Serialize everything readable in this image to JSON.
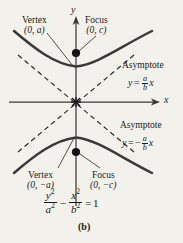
{
  "figure": {
    "caption": "(b)",
    "type": "hyperbola-diagram",
    "orientation": "vertical-transverse-axis",
    "background_color": "#f3f1ec",
    "ink_color": "#1c1b19",
    "axes": {
      "x_label": "x",
      "y_label": "y",
      "origin_px": [
        76,
        102
      ]
    },
    "labels": {
      "vertex_top_title": "Vertex",
      "vertex_top_coords": "(0, a)",
      "focus_top_title": "Focus",
      "focus_top_coords": "(0, c)",
      "vertex_bottom_title": "Vertex",
      "vertex_bottom_coords": "(0, −a)",
      "focus_bottom_title": "Focus",
      "focus_bottom_coords": "(0, −c)",
      "asymptote_top_title": "Asymptote",
      "asymptote_bottom_title": "Asymptote"
    },
    "equations": {
      "asymptote_positive": {
        "lhs": "y",
        "equals": "=",
        "sign": "",
        "numerator": "a",
        "denominator": "b",
        "variable": "x",
        "plain": "y = (a/b) x"
      },
      "asymptote_negative": {
        "lhs": "y",
        "equals": "=",
        "sign": "−",
        "numerator": "a",
        "denominator": "b",
        "variable": "x",
        "plain": "y = −(a/b) x"
      },
      "hyperbola": {
        "term1_num": "y",
        "term1_num_exp": "2",
        "term1_den": "a",
        "term1_den_exp": "2",
        "operator": "−",
        "term2_num": "x",
        "term2_num_exp": "2",
        "term2_den": "b",
        "term2_den_exp": "2",
        "equals": "=",
        "rhs": "1",
        "plain": "y²/a² − x²/b² = 1"
      }
    },
    "markers": {
      "focus_top_point": "(0, c)",
      "focus_bottom_point": "(0, −c)",
      "vertex_top_point": "(0, a)",
      "vertex_bottom_point": "(0, −a)",
      "origin_point": "(0, 0)"
    }
  }
}
